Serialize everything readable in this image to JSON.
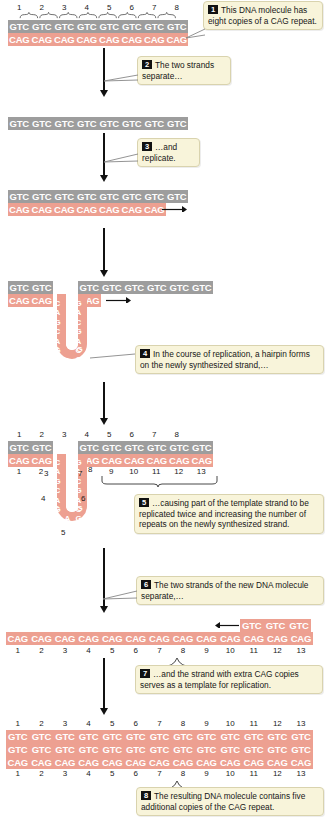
{
  "figure": {
    "colors": {
      "template_strand": "#9d9d9d",
      "new_strand": "#eda091",
      "callout_bg": "#f8f4da",
      "callout_border": "#d9d3ae",
      "badge_bg": "#111111",
      "text": "#171717"
    }
  },
  "steps": [
    {
      "num": "1",
      "text": "This DNA molecule has eight copies of a CAG repeat."
    },
    {
      "num": "2",
      "text": "The two strands separate…"
    },
    {
      "num": "3",
      "text": "…and replicate."
    },
    {
      "num": "4",
      "text": "In the course of replication, a hairpin forms on the newly synthesized strand,…"
    },
    {
      "num": "5",
      "text": "…causing part of the template strand to be replicated twice and increasing the number of repeats on the newly synthesized strand."
    },
    {
      "num": "6",
      "text": "The two strands of the new DNA molecule separate,…"
    },
    {
      "num": "7",
      "text": "…and the strand with extra CAG copies serves as a template for replication."
    },
    {
      "num": "8",
      "text": "The resulting DNA molecule contains five additional copies of the CAG repeat."
    }
  ],
  "panels": {
    "p1": {
      "top_numbers": [
        "1",
        "2",
        "3",
        "4",
        "5",
        "6",
        "7",
        "8"
      ],
      "top_strand": [
        "GTC",
        "GTC",
        "GTC",
        "GTC",
        "GTC",
        "GTC",
        "GTC",
        "GTC"
      ],
      "bottom_strand": [
        "CAG",
        "CAG",
        "CAG",
        "CAG",
        "CAG",
        "CAG",
        "CAG",
        "CAG"
      ]
    },
    "p2": {
      "top_strand": [
        "GTC",
        "GTC",
        "GTC",
        "GTC",
        "GTC",
        "GTC",
        "GTC",
        "GTC"
      ]
    },
    "p3": {
      "top_strand": [
        "GTC",
        "GTC",
        "GTC",
        "GTC",
        "GTC",
        "GTC",
        "GTC",
        "GTC"
      ],
      "bottom_strand": [
        "CAG",
        "CAG",
        "CAG",
        "CAG",
        "CAG",
        "CAG",
        "CAG"
      ],
      "arrow": "replication-direction-arrow"
    },
    "p4": {
      "top_left": [
        "GTC",
        "GTC"
      ],
      "top_right": [
        "GTC",
        "GTC",
        "GTC",
        "GTC",
        "GTC",
        "GTC"
      ],
      "bottom_left": [
        "CAG",
        "CAG"
      ],
      "bottom_right": [
        "CAG"
      ],
      "hairpin_left_letters": [
        "C",
        "A",
        "G",
        "C",
        "A",
        "G",
        "C",
        "A",
        "G"
      ],
      "hairpin_right_letters": [
        "G",
        "A",
        "C",
        "G",
        "A",
        "C",
        "G",
        "A",
        "C"
      ],
      "hairpin_loop": {
        "left": "C",
        "right": "G",
        "bottom": "A"
      }
    },
    "p5": {
      "top_numbers": [
        "1",
        "2",
        "3",
        "4",
        "5",
        "6",
        "7",
        "8"
      ],
      "top_left": [
        "GTC",
        "GTC"
      ],
      "top_right": [
        "GTC",
        "GTC",
        "GTC",
        "GTC",
        "GTC",
        "GTC"
      ],
      "bottom_left": [
        "CAG",
        "CAG"
      ],
      "bottom_right": [
        "CAG",
        "CAG",
        "CAG",
        "CAG",
        "CAG",
        "CAG"
      ],
      "bottom_numbers_left": [
        "1",
        "2"
      ],
      "bottom_numbers_right": [
        "9",
        "10",
        "11",
        "12",
        "13"
      ],
      "hairpin_numbers": [
        "3",
        "4",
        "5",
        "6",
        "7",
        "8"
      ],
      "bracket_label": "repeats 9-13 bracket"
    },
    "p6": {
      "long_strand": [
        "CAG",
        "CAG",
        "CAG",
        "CAG",
        "CAG",
        "CAG",
        "CAG",
        "CAG",
        "CAG",
        "CAG",
        "CAG",
        "CAG",
        "CAG"
      ],
      "numbers": [
        "1",
        "2",
        "3",
        "4",
        "5",
        "6",
        "7",
        "8",
        "9",
        "10",
        "11",
        "12",
        "13"
      ],
      "short_strand": [
        "GTC",
        "GTC",
        "GTC"
      ],
      "arrow": "leftward-replication-arrow"
    },
    "p7": {
      "numbers": [
        "1",
        "2",
        "3",
        "4",
        "5",
        "6",
        "7",
        "8",
        "9",
        "10",
        "11",
        "12",
        "13"
      ],
      "top_strand": [
        "GTC",
        "GTC",
        "GTC",
        "GTC",
        "GTC",
        "GTC",
        "GTC",
        "GTC",
        "GTC",
        "GTC",
        "GTC",
        "GTC",
        "GTC"
      ]
    },
    "p8": {
      "top_strand": [
        "GTC",
        "GTC",
        "GTC",
        "GTC",
        "GTC",
        "GTC",
        "GTC",
        "GTC",
        "GTC",
        "GTC",
        "GTC",
        "GTC",
        "GTC"
      ],
      "bottom_strand": [
        "CAG",
        "CAG",
        "CAG",
        "CAG",
        "CAG",
        "CAG",
        "CAG",
        "CAG",
        "CAG",
        "CAG",
        "CAG",
        "CAG",
        "CAG"
      ],
      "numbers": [
        "1",
        "2",
        "3",
        "4",
        "5",
        "6",
        "7",
        "8",
        "9",
        "10",
        "11",
        "12",
        "13"
      ]
    }
  }
}
